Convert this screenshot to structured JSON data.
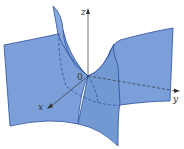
{
  "figure": {
    "surface_color": "#7b9fd8",
    "edge_color": "#2c4f9c",
    "axis_color": "#333333",
    "labels": {
      "z_axis": "z",
      "y_axis": "y",
      "x_axis": "x",
      "origin": "0"
    }
  }
}
